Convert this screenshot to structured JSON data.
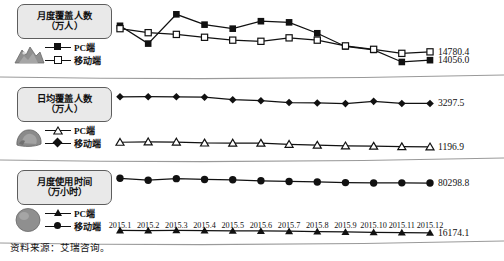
{
  "figure": {
    "source_note": "资料来源：艾瑞咨询。",
    "axis": {
      "tick_labels": [
        "2015.1",
        "2015.2",
        "2015.3",
        "2015.4",
        "2015.5",
        "2015.6",
        "2015.7",
        "2015.8",
        "2015.9",
        "2015.10",
        "2015.11",
        "2015.12"
      ]
    },
    "colors": {
      "ink": "#111111",
      "pill_fill": "#e9e9e9",
      "pill_border": "#5d5d5d",
      "thumb_fill": "#8a8a8a"
    }
  },
  "chart_data": [
    {
      "type": "line",
      "title": "月度覆盖人数",
      "subtitle": "（万人）",
      "thumbnail_icon": "mountain-thumbnail-icon",
      "xlabel": "",
      "ylabel": "万人",
      "x": [
        "2015.1",
        "2015.2",
        "2015.3",
        "2015.4",
        "2015.5",
        "2015.6",
        "2015.7",
        "2015.8",
        "2015.9",
        "2015.10",
        "2015.11",
        "2015.12"
      ],
      "ylim": [
        13200,
        18600
      ],
      "grid": false,
      "legend_position": "left",
      "series": [
        {
          "name": "PC端",
          "marker": "filled-square",
          "values": [
            17050,
            15500,
            18050,
            17150,
            16800,
            17450,
            17350,
            16400,
            15250,
            14950,
            13900,
            14056.0
          ],
          "end_label": "14056.0"
        },
        {
          "name": "移动端",
          "marker": "open-square",
          "values": [
            16800,
            16450,
            16300,
            16050,
            15800,
            15700,
            16000,
            15800,
            15300,
            15000,
            14650,
            14780.4
          ],
          "end_label": "14780.4"
        }
      ]
    },
    {
      "type": "line",
      "title": "日均覆盖人数",
      "subtitle": "（万人）",
      "thumbnail_icon": "rock-thumbnail-icon",
      "xlabel": "",
      "ylabel": "万人",
      "x": [
        "2015.1",
        "2015.2",
        "2015.3",
        "2015.4",
        "2015.5",
        "2015.6",
        "2015.7",
        "2015.8",
        "2015.9",
        "2015.10",
        "2015.11",
        "2015.12"
      ],
      "ylim": [
        900,
        3900
      ],
      "grid": false,
      "legend_position": "left",
      "series": [
        {
          "name": "移动端",
          "marker": "filled-diamond",
          "values": [
            3620,
            3625,
            3620,
            3600,
            3480,
            3430,
            3340,
            3320,
            3290,
            3400,
            3297.5,
            3297.5
          ],
          "end_label": "3297.5"
        },
        {
          "name": "PC端",
          "marker": "open-triangle",
          "values": [
            1420,
            1440,
            1430,
            1385,
            1380,
            1375,
            1320,
            1280,
            1245,
            1230,
            1205,
            1196.9
          ],
          "end_label": "1196.9"
        }
      ]
    },
    {
      "type": "line",
      "title": "月度使用时间",
      "subtitle": "（万小时）",
      "thumbnail_icon": "circle-thumbnail-icon",
      "xlabel": "",
      "ylabel": "万小时",
      "x": [
        "2015.1",
        "2015.2",
        "2015.3",
        "2015.4",
        "2015.5",
        "2015.6",
        "2015.7",
        "2015.8",
        "2015.9",
        "2015.10",
        "2015.11",
        "2015.12"
      ],
      "ylim": [
        12000,
        92000
      ],
      "grid": false,
      "legend_position": "left",
      "series": [
        {
          "name": "移动端",
          "marker": "filled-circle",
          "values": [
            86500,
            84000,
            86000,
            85000,
            84500,
            83200,
            82400,
            81700,
            80900,
            80400,
            80600,
            80298.8
          ],
          "end_label": "80298.8"
        },
        {
          "name": "PC端",
          "marker": "filled-triangle",
          "values": [
            19200,
            19100,
            19300,
            19000,
            18700,
            18500,
            18200,
            17700,
            17200,
            16800,
            16400,
            16174.1
          ],
          "end_label": "16174.1"
        }
      ]
    }
  ]
}
